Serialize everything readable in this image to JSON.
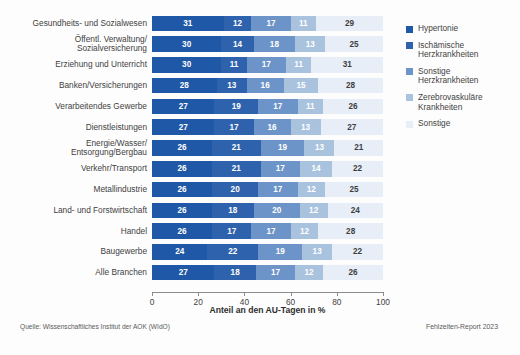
{
  "chart_data": {
    "type": "bar",
    "orientation": "horizontal",
    "stacked": true,
    "title": "",
    "xlabel": "Anteil an den AU-Tagen in %",
    "ylabel": "",
    "xlim": [
      0,
      100
    ],
    "xticks": [
      0,
      20,
      40,
      60,
      80,
      100
    ],
    "grid": false,
    "legend_position": "right",
    "categories": [
      "Gesundheits- und Sozialwesen",
      "Öffentl. Verwaltung/\nSozialversicherung",
      "Erziehung und Unterricht",
      "Banken/Versicherungen",
      "Verarbeitendes Gewerbe",
      "Dienstleistungen",
      "Energie/Wasser/\nEntsorgung/Bergbau",
      "Verkehr/Transport",
      "Metallindustrie",
      "Land- und Forstwirtschaft",
      "Handel",
      "Baugewerbe",
      "Alle Branchen"
    ],
    "series": [
      {
        "name": "Hypertonie",
        "color": "#1f58a6",
        "values": [
          31,
          30,
          30,
          28,
          27,
          27,
          26,
          26,
          26,
          26,
          26,
          24,
          27
        ]
      },
      {
        "name": "Ischämische\nHerzkrankheiten",
        "color": "#2f62ac",
        "values": [
          12,
          14,
          11,
          13,
          19,
          17,
          21,
          21,
          20,
          18,
          17,
          22,
          18
        ]
      },
      {
        "name": "Sonstige\nHerzkrankheiten",
        "color": "#6d94c8",
        "values": [
          17,
          18,
          17,
          16,
          17,
          16,
          19,
          17,
          17,
          20,
          17,
          19,
          17
        ]
      },
      {
        "name": "Zerebrovaskuläre\nKrankheiten",
        "color": "#a9c2de",
        "values": [
          11,
          13,
          11,
          15,
          11,
          13,
          13,
          14,
          12,
          12,
          12,
          13,
          12
        ]
      },
      {
        "name": "Sonstige",
        "color": "#e7eef7",
        "values": [
          29,
          25,
          31,
          28,
          26,
          27,
          21,
          22,
          25,
          24,
          28,
          22,
          26
        ]
      }
    ]
  },
  "legend": {
    "items": [
      {
        "label": "Hypertonie",
        "color": "#1f58a6"
      },
      {
        "label": "Ischämische\nHerzkrankheiten",
        "color": "#2f62ac"
      },
      {
        "label": "Sonstige\nHerzkrankheiten",
        "color": "#6d94c8"
      },
      {
        "label": "Zerebrovaskuläre\nKrankheiten",
        "color": "#a9c2de"
      },
      {
        "label": "Sonstige",
        "color": "#e7eef7"
      }
    ]
  },
  "footer": {
    "source": "Quelle: Wissenschaftliches Institut der AOK (WIdO)",
    "report": "Fehlzeiten-Report 2023"
  }
}
